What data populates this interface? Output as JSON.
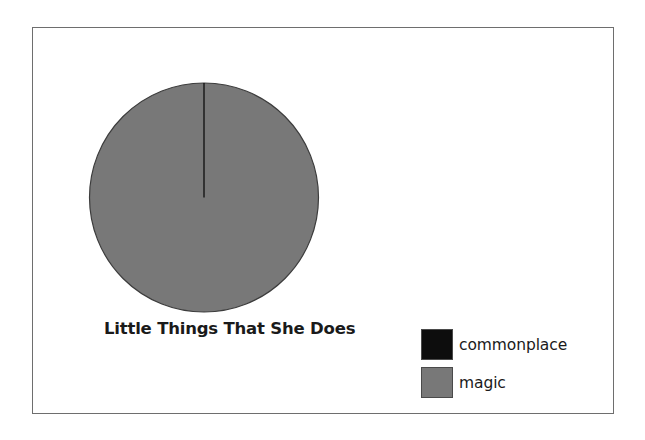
{
  "chart_data": {
    "type": "pie",
    "title": "Little Things That She Does",
    "categories": [
      "commonplace",
      "magic"
    ],
    "values": [
      0.2,
      99.8
    ],
    "colors": [
      "#0d0d0d",
      "#787878"
    ],
    "legend_position": "bottom-right",
    "start_angle_deg": 90,
    "direction": "clockwise",
    "labels_shown": false,
    "grid": false,
    "slices": [
      {
        "label": "commonplace",
        "value": 0.2,
        "color": "#0d0d0d"
      },
      {
        "label": "magic",
        "value": 99.8,
        "color": "#787878"
      }
    ]
  },
  "figure": {
    "background_color": "#ffffff",
    "frame_color": "#6e6e6e",
    "outline_color": "#3c3c3c"
  },
  "pie": {
    "title": "Little Things That She Does"
  },
  "legend": {
    "entries": [
      {
        "label": "commonplace",
        "color": "#0d0d0d"
      },
      {
        "label": "magic",
        "color": "#787878"
      }
    ]
  }
}
